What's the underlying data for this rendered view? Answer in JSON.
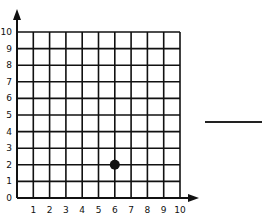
{
  "chart_data": {
    "type": "scatter",
    "title": "",
    "xlabel": "",
    "ylabel": "",
    "xlim": [
      0,
      10
    ],
    "ylim": [
      0,
      10
    ],
    "grid": true,
    "x_ticks": [
      "1",
      "2",
      "3",
      "4",
      "5",
      "6",
      "7",
      "8",
      "9",
      "10"
    ],
    "y_ticks": [
      "0",
      "1",
      "2",
      "3",
      "4",
      "5",
      "6",
      "7",
      "8",
      "9",
      "10"
    ],
    "points": [
      {
        "x": 6,
        "y": 2
      }
    ]
  },
  "answer": {
    "blank": ""
  },
  "colors": {
    "ink": "#111111",
    "background": "#ffffff"
  }
}
